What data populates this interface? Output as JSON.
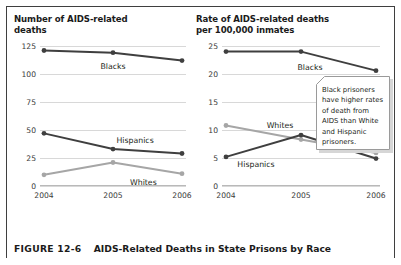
{
  "figure": {
    "number": "FIGURE 12-6",
    "caption": "AIDS-Related Deaths in State Prisons by Race"
  },
  "callout": {
    "text": "Black prisoners have higher rates of death from AIDS than White and Hispanic prisoners."
  },
  "colors": {
    "dark_series": "#3f3f3f",
    "light_series": "#a6a6a6",
    "gridline": "#d8d8d8",
    "text": "#231f20"
  },
  "chart_data": [
    {
      "type": "line",
      "title": "Number of AIDS-related deaths",
      "xlabel": "",
      "ylabel": "Number of AIDS-related deaths",
      "categories": [
        "2004",
        "2005",
        "2006"
      ],
      "yticks": [
        0,
        25,
        50,
        75,
        100,
        125
      ],
      "ylim": [
        0,
        125
      ],
      "grid": true,
      "legend": "inline-labels",
      "series": [
        {
          "name": "Blacks",
          "values": [
            121,
            119,
            112
          ],
          "color": "#3f3f3f"
        },
        {
          "name": "Hispanics",
          "values": [
            47,
            33,
            29
          ],
          "color": "#3f3f3f"
        },
        {
          "name": "Whites",
          "values": [
            10,
            21,
            11
          ],
          "color": "#a6a6a6"
        }
      ]
    },
    {
      "type": "line",
      "title": "Rate of AIDS-related deaths per 100,000 inmates",
      "xlabel": "",
      "ylabel": "Rate of AIDS-related deaths per 100,000 inmates",
      "categories": [
        "2004",
        "2005",
        "2006"
      ],
      "yticks": [
        0,
        5,
        10,
        15,
        20,
        25
      ],
      "ylim": [
        0,
        25
      ],
      "grid": true,
      "legend": "inline-labels",
      "series": [
        {
          "name": "Blacks",
          "values": [
            24.0,
            24.0,
            20.6
          ],
          "color": "#3f3f3f"
        },
        {
          "name": "Whites",
          "values": [
            10.8,
            8.3,
            5.9
          ],
          "color": "#a6a6a6"
        },
        {
          "name": "Hispanics",
          "values": [
            5.2,
            9.1,
            4.9
          ],
          "color": "#3f3f3f"
        }
      ]
    }
  ],
  "panels": {
    "left": {
      "title_line1": "Number of AIDS-related",
      "title_line2": "deaths"
    },
    "right": {
      "title_line1": "Rate of AIDS-related deaths",
      "title_line2": "per 100,000 inmates"
    }
  }
}
